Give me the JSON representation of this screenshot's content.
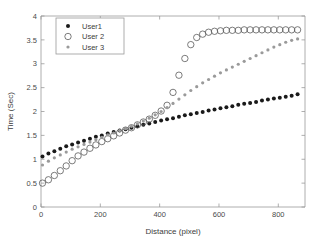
{
  "chart_data": {
    "type": "scatter",
    "title": "",
    "xlabel": "Distance (pixel)",
    "ylabel": "Time (Sec)",
    "xlim": [
      0,
      890
    ],
    "ylim": [
      0,
      4
    ],
    "xticks": [
      0,
      200,
      400,
      600,
      800
    ],
    "xtick_labels": [
      "0",
      "200",
      "400",
      "600",
      "800"
    ],
    "yticks": [
      0,
      0.5,
      1,
      1.5,
      2,
      2.5,
      3,
      3.5,
      4
    ],
    "ytick_labels": [
      "0",
      "0.5",
      "1",
      "1.5",
      "2",
      "2.5",
      "3",
      "3.5",
      "4"
    ],
    "grid": false,
    "legend_position": "upper left",
    "series": [
      {
        "name": "User1",
        "marker": "filled-dot",
        "color": "#1a1a1a",
        "marker_size": 2.0,
        "x": [
          5,
          25,
          45,
          65,
          85,
          105,
          125,
          145,
          165,
          185,
          205,
          225,
          245,
          265,
          285,
          305,
          325,
          345,
          365,
          385,
          405,
          425,
          445,
          465,
          485,
          505,
          525,
          545,
          565,
          585,
          605,
          625,
          645,
          665,
          685,
          705,
          725,
          745,
          765,
          785,
          805,
          825,
          845,
          865
        ],
        "y": [
          1.06,
          1.12,
          1.17,
          1.22,
          1.27,
          1.31,
          1.35,
          1.39,
          1.43,
          1.47,
          1.5,
          1.54,
          1.57,
          1.6,
          1.63,
          1.66,
          1.69,
          1.72,
          1.75,
          1.78,
          1.81,
          1.84,
          1.86,
          1.89,
          1.92,
          1.94,
          1.97,
          1.99,
          2.02,
          2.04,
          2.07,
          2.09,
          2.11,
          2.14,
          2.16,
          2.18,
          2.2,
          2.23,
          2.25,
          2.27,
          2.29,
          2.31,
          2.33,
          2.36
        ]
      },
      {
        "name": "User 2",
        "marker": "open-circle",
        "color": "#5a5a5a",
        "marker_size": 3.2,
        "x": [
          5,
          25,
          45,
          65,
          85,
          105,
          125,
          145,
          165,
          185,
          205,
          225,
          245,
          265,
          285,
          305,
          325,
          345,
          365,
          385,
          405,
          425,
          445,
          465,
          485,
          505,
          525,
          545,
          565,
          585,
          605,
          625,
          645,
          665,
          685,
          705,
          725,
          745,
          765,
          785,
          805,
          825,
          845,
          865
        ],
        "y": [
          0.5,
          0.57,
          0.66,
          0.76,
          0.86,
          0.97,
          1.07,
          1.15,
          1.23,
          1.3,
          1.37,
          1.43,
          1.49,
          1.55,
          1.61,
          1.66,
          1.72,
          1.78,
          1.84,
          1.92,
          2.01,
          2.13,
          2.4,
          2.76,
          3.11,
          3.4,
          3.55,
          3.62,
          3.66,
          3.68,
          3.69,
          3.7,
          3.7,
          3.7,
          3.71,
          3.71,
          3.71,
          3.71,
          3.71,
          3.71,
          3.71,
          3.71,
          3.71,
          3.71
        ]
      },
      {
        "name": "User 3",
        "marker": "small-dot",
        "color": "#9a9a9a",
        "marker_size": 1.6,
        "x": [
          5,
          25,
          45,
          65,
          85,
          105,
          125,
          145,
          165,
          185,
          205,
          225,
          245,
          265,
          285,
          305,
          325,
          345,
          365,
          385,
          405,
          425,
          445,
          465,
          485,
          505,
          525,
          545,
          565,
          585,
          605,
          625,
          645,
          665,
          685,
          705,
          725,
          745,
          765,
          785,
          805,
          825,
          845,
          865
        ],
        "y": [
          0.88,
          0.96,
          1.03,
          1.09,
          1.15,
          1.21,
          1.26,
          1.31,
          1.36,
          1.41,
          1.46,
          1.51,
          1.55,
          1.6,
          1.64,
          1.69,
          1.74,
          1.8,
          1.86,
          1.93,
          2.0,
          2.08,
          2.17,
          2.26,
          2.35,
          2.44,
          2.52,
          2.6,
          2.67,
          2.74,
          2.81,
          2.87,
          2.93,
          2.99,
          3.05,
          3.11,
          3.17,
          3.23,
          3.29,
          3.35,
          3.4,
          3.45,
          3.49,
          3.52
        ]
      }
    ]
  },
  "legend": {
    "entries": [
      {
        "label": "User1"
      },
      {
        "label": "User 2"
      },
      {
        "label": "User 3"
      }
    ]
  }
}
